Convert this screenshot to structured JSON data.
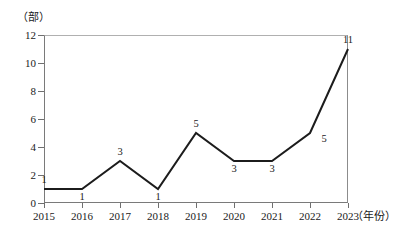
{
  "chart_data": {
    "type": "line",
    "title": "",
    "subtitle": "",
    "xlabel": "（年份）",
    "ylabel": "（部）",
    "categories": [
      "2015",
      "2016",
      "2017",
      "2018",
      "2019",
      "2020",
      "2021",
      "2022",
      "2023"
    ],
    "values": [
      1,
      1,
      3,
      1,
      5,
      3,
      3,
      5,
      11
    ],
    "series": [
      {
        "name": "",
        "values": [
          1,
          1,
          3,
          1,
          5,
          3,
          3,
          5,
          11
        ]
      }
    ],
    "data_labels": [
      "1",
      "1",
      "3",
      "1",
      "5",
      "3",
      "3",
      "5",
      "11"
    ],
    "data_label_positions": [
      "above",
      "below",
      "above",
      "below",
      "above",
      "below",
      "below",
      "right",
      "above"
    ],
    "xlim": [
      2015,
      2023
    ],
    "ylim": [
      0,
      12
    ],
    "ytick_labels": [
      "0",
      "2",
      "4",
      "6",
      "8",
      "10",
      "12"
    ],
    "ytick_values": [
      0,
      2,
      4,
      6,
      8,
      10,
      12
    ],
    "xtick_labels": [
      "2015",
      "2016",
      "2017",
      "2018",
      "2019",
      "2020",
      "2021",
      "2022",
      "2023"
    ],
    "grid": false,
    "legend": false,
    "legend_position": "none",
    "line_color": "#1c1c1c",
    "frame_color": "#7a7a7a",
    "background_color": "#ffffff",
    "markers": false
  }
}
